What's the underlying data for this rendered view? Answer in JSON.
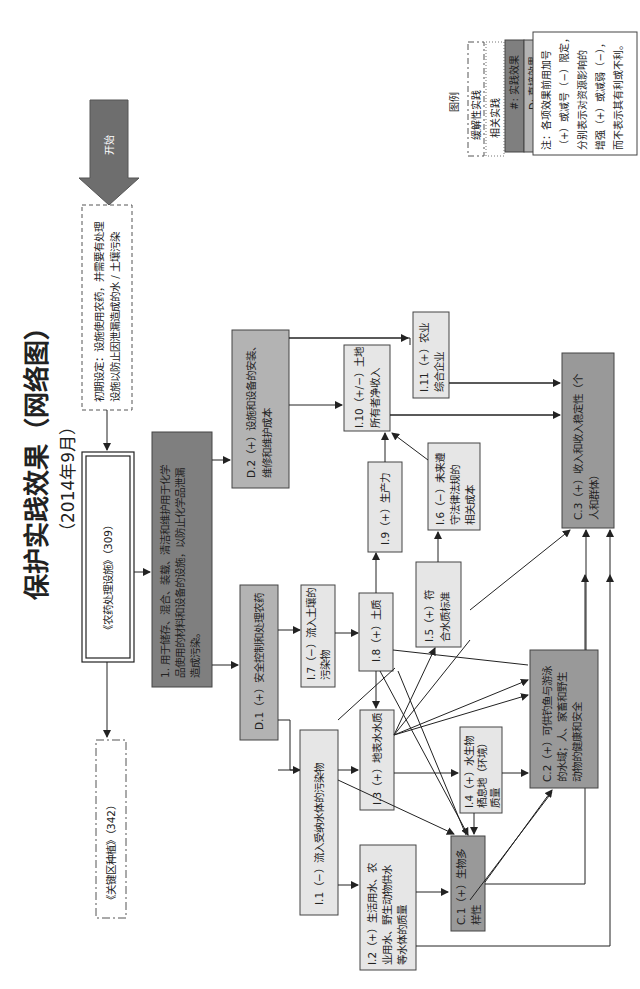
{
  "title": "保护实践效果（网络图）",
  "subtitle": "（2014年9月）",
  "start_label": "开始",
  "initial_setting": {
    "line1": "初期设定：设施使用农药，并需要有处理",
    "line2": "设施以防止因泄漏造成的水 / 土壤污染"
  },
  "practice": {
    "name": "《农药处理设施》（309）",
    "related": "《关键区种植》（342）",
    "effect_line1": "1. 用于储存、混合、装载、清洁和维护用于化学",
    "effect_line2": "品使用的材料和设备的设施，以防止化学品泄漏",
    "effect_line3": "造成污染。"
  },
  "nodes": {
    "D1": {
      "line1": "D.1（+）安全控制和处理农药"
    },
    "D2": {
      "line1": "D.2（+）设施和设备的安装、",
      "line2": "维修和维护成本"
    },
    "I1": {
      "line1": "I.1（−）流入受纳水体的污染物"
    },
    "I2": {
      "line1": "I.2（+）生活用水、农",
      "line2": "业用水、野生动物供水",
      "line3": "等水体的质量"
    },
    "I3": {
      "line1": "I.3（+）地表水水质"
    },
    "I4": {
      "line1": "I.4（+）水生物",
      "line2": "栖息地（环境）",
      "line3": "质量"
    },
    "I5": {
      "line1": "I.5（+）符",
      "line2": "合水质标准"
    },
    "I6": {
      "line1": "I.6（−）未来遵",
      "line2": "守法律法规的",
      "line3": "相关成本"
    },
    "I7": {
      "line1": "I.7（−）流入土壤的",
      "line2": "污染物"
    },
    "I8": {
      "line1": "I.8（+）土质"
    },
    "I9": {
      "line1": "I.9（+）生产力"
    },
    "I10": {
      "line1": "I.10（+/−）土地",
      "line2": "所有者净收入"
    },
    "I11": {
      "line1": "I.11（+）农业",
      "line2": "综合企业"
    },
    "C1": {
      "line1": "C.1（+）生物多",
      "line2": "样性"
    },
    "C2": {
      "line1": "C.2（+）可供钓鱼与游泳",
      "line2": "的水域；人、家畜和野生",
      "line3": "动物的健康和安全"
    },
    "C3": {
      "line1": "C.3（+）收入和收入稳定性（个",
      "line2": "人和群体）"
    }
  },
  "legend": {
    "title": "图例",
    "items": [
      {
        "label": "缓解性实践",
        "style": "dash-dot",
        "color": "#ffffff"
      },
      {
        "label": "相关实践",
        "style": "dotted",
        "color": "#ffffff"
      },
      {
        "label": "#: 实践效果",
        "style": "solid",
        "color": "#7f7f7f"
      },
      {
        "label": "D: 直接效果",
        "style": "solid",
        "color": "#b3b3b3"
      },
      {
        "label": "I: 间接效果",
        "style": "solid",
        "color": "#e6e6e6"
      },
      {
        "label": "C: 累积效果",
        "style": "solid",
        "color": "#999999"
      }
    ],
    "path_label": "路径",
    "note_line1": "注：各项效果前用加号",
    "note_line2": "（+）或减号（−）限定，",
    "note_line3": "分别表示对资源影响的",
    "note_line4": "增强（+）或减弱（−），",
    "note_line5": "而不表示其有利或不利。"
  },
  "colors": {
    "practice_effect": "#7f7f7f",
    "direct": "#b3b3b3",
    "indirect": "#e6e6e6",
    "cumulative": "#999999",
    "arrow": "#555555",
    "line": "#222222"
  }
}
